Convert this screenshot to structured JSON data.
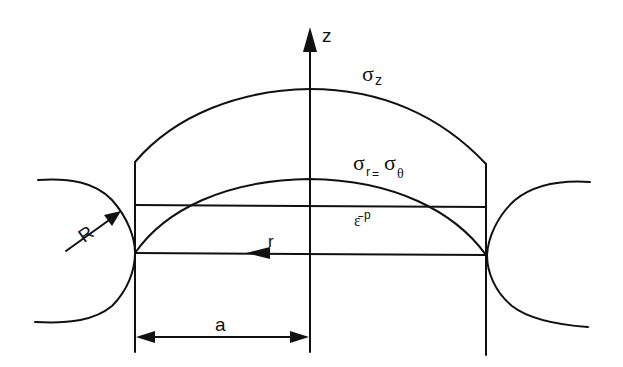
{
  "diagram": {
    "type": "stress-distribution-schematic",
    "colors": {
      "line": "#111111",
      "background": "#ffffff"
    },
    "axes": {
      "z_axis": {
        "label": "z",
        "direction": "up"
      },
      "r_axis": {
        "label": "r",
        "direction": "left"
      }
    },
    "curves": {
      "sigma_z": {
        "symbol": "σ",
        "subscript": "z"
      },
      "sigma_r_theta": {
        "symbol_1": "σ",
        "subscript_1": "r",
        "equals": "=",
        "symbol_2": "σ",
        "subscript_2": "θ"
      },
      "eps_p": {
        "symbol": "ε̄",
        "superscript": "p"
      }
    },
    "dimensions": {
      "radius": {
        "label": "R"
      },
      "half_width": {
        "label": "a"
      }
    }
  }
}
